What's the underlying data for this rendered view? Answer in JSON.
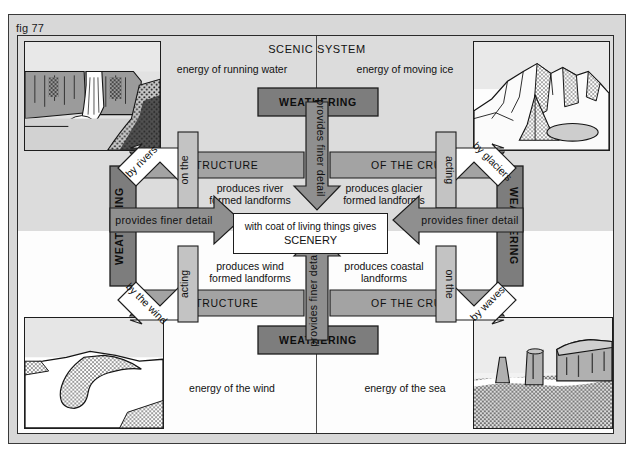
{
  "figure": {
    "label": "fig 77",
    "title": "SCENIC SYSTEM"
  },
  "colors": {
    "page_frame": "#d8d8d8",
    "upper_background": "#dcdcdc",
    "lower_background": "#fdfdfd",
    "arrow_mid_grey": "#8f8f8f",
    "arrow_light_grey": "#c3c3c3",
    "bar_dark_grey": "#7d7d7d",
    "outline": "#1d1d1d"
  },
  "energy_labels": [
    {
      "name": "energy-running-water",
      "text": "energy of running water",
      "quadrant": "top-left"
    },
    {
      "name": "energy-moving-ice",
      "text": "energy of moving ice",
      "quadrant": "top-right"
    },
    {
      "name": "energy-wind",
      "text": "energy of the wind",
      "quadrant": "bottom-left"
    },
    {
      "name": "energy-sea",
      "text": "energy of the sea",
      "quadrant": "bottom-right"
    }
  ],
  "weathering_bars": [
    {
      "name": "weathering-top",
      "text": "WEATHERING",
      "orientation": "horizontal",
      "position": "top"
    },
    {
      "name": "weathering-bottom",
      "text": "WEATHERING",
      "orientation": "horizontal",
      "position": "bottom"
    },
    {
      "name": "weathering-left",
      "text": "WEATHERING",
      "orientation": "vertical",
      "position": "left"
    },
    {
      "name": "weathering-right",
      "text": "WEATHERING",
      "orientation": "vertical",
      "position": "right"
    }
  ],
  "structure_bars": [
    {
      "name": "structure-top-left",
      "text": "STRUCTURE",
      "position": "top-left"
    },
    {
      "name": "crust-top-right",
      "text": "OF THE CRUST",
      "position": "top-right"
    },
    {
      "name": "structure-bottom-left",
      "text": "STRUCTURE",
      "position": "bottom-left"
    },
    {
      "name": "crust-bottom-right",
      "text": "OF THE CRUST",
      "position": "bottom-right"
    }
  ],
  "provides_arrows": [
    {
      "name": "provides-top",
      "text": "provides finer detail",
      "direction": "down"
    },
    {
      "name": "provides-bottom",
      "text": "provides finer detail",
      "direction": "up"
    },
    {
      "name": "provides-left",
      "text": "provides finer detail",
      "direction": "right"
    },
    {
      "name": "provides-right",
      "text": "provides finer detail",
      "direction": "left"
    }
  ],
  "agent_arrows": [
    {
      "name": "agent-rivers",
      "agent": "by rivers",
      "verb": "on the",
      "quadrant": "top-left"
    },
    {
      "name": "agent-glaciers",
      "agent": "by glaciers",
      "verb": "acting",
      "quadrant": "top-right"
    },
    {
      "name": "agent-wind",
      "agent": "by the wind",
      "verb": "acting",
      "quadrant": "bottom-left"
    },
    {
      "name": "agent-waves",
      "agent": "by waves",
      "verb": "on the",
      "quadrant": "bottom-right"
    }
  ],
  "produces_labels": [
    {
      "name": "produces-river",
      "line1": "produces river",
      "line2": "formed landforms",
      "quadrant": "top-left"
    },
    {
      "name": "produces-glacier",
      "line1": "produces glacier",
      "line2": "formed landforms",
      "quadrant": "top-right"
    },
    {
      "name": "produces-wind",
      "line1": "produces wind",
      "line2": "formed landforms",
      "quadrant": "bottom-left"
    },
    {
      "name": "produces-coastal",
      "line1": "produces coastal",
      "line2": "landforms",
      "quadrant": "bottom-right"
    }
  ],
  "scenery": {
    "line1": "with coat of living things gives",
    "line2": "SCENERY"
  },
  "photos": [
    {
      "name": "photo-waterfall",
      "subject": "waterfall",
      "quadrant": "top-left"
    },
    {
      "name": "photo-mountains",
      "subject": "glaciated mountains",
      "quadrant": "top-right"
    },
    {
      "name": "photo-dune",
      "subject": "sand dune",
      "quadrant": "bottom-left"
    },
    {
      "name": "photo-sea-stacks",
      "subject": "coastal stacks",
      "quadrant": "bottom-right"
    }
  ]
}
